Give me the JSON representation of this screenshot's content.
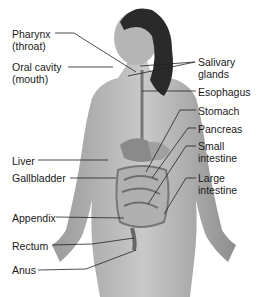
{
  "diagram": {
    "labels_left": [
      {
        "id": "pharynx",
        "text": "Pharynx\n(throat)",
        "x": 12,
        "y": 28
      },
      {
        "id": "oral-cavity",
        "text": "Oral cavity\n(mouth)",
        "x": 12,
        "y": 61
      },
      {
        "id": "liver",
        "text": "Liver",
        "x": 12,
        "y": 155
      },
      {
        "id": "gallbladder",
        "text": "Gallbladder",
        "x": 12,
        "y": 172
      },
      {
        "id": "appendix",
        "text": "Appendix",
        "x": 12,
        "y": 212
      },
      {
        "id": "rectum",
        "text": "Rectum",
        "x": 12,
        "y": 240
      },
      {
        "id": "anus",
        "text": "Anus",
        "x": 12,
        "y": 264
      }
    ],
    "labels_right": [
      {
        "id": "salivary-glands",
        "text": "Salivary\nglands",
        "x": 198,
        "y": 56
      },
      {
        "id": "esophagus",
        "text": "Esophagus",
        "x": 198,
        "y": 88
      },
      {
        "id": "stomach",
        "text": "Stomach",
        "x": 198,
        "y": 107
      },
      {
        "id": "pancreas",
        "text": "Pancreas",
        "x": 198,
        "y": 125
      },
      {
        "id": "small-intestine",
        "text": "Small\nintestine",
        "x": 198,
        "y": 142
      },
      {
        "id": "large-intestine",
        "text": "Large\nintestine",
        "x": 198,
        "y": 172
      }
    ]
  }
}
